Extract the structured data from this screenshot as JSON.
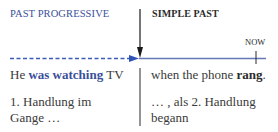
{
  "labels": {
    "left_heading": "PAST PROGRESSIVE",
    "right_heading": "SIMPLE PAST",
    "now": "NOW"
  },
  "sentence": {
    "left_prefix": "He ",
    "left_highlight": "was watching",
    "left_suffix": " TV",
    "right_prefix": "when the phone ",
    "right_bold": "rang",
    "right_suffix": "."
  },
  "notes": {
    "left_line1": "1. Handlung im",
    "left_line2": "Gange …",
    "right_line1": "… , als 2. Handlung",
    "right_line2": "begann"
  },
  "colors": {
    "progressive_blue": "#3b4f9a",
    "timeline_blue": "#5b6fb5",
    "arrow_black": "#1a1a1a",
    "text": "#3a3a3a"
  }
}
